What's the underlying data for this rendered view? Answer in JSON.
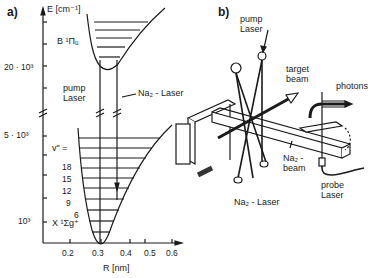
{
  "figure": {
    "panel_a": {
      "label": "a)",
      "y_axis_label": "E [cm⁻¹]",
      "y_ticks": [
        "20 · 10³",
        "5 · 10³",
        "10³"
      ],
      "x_axis_label": "R [nm]",
      "x_ticks": [
        "0.2",
        "0.3",
        "0.4",
        "0.5",
        "0.6"
      ],
      "upper_state": "B ¹Πᵤ",
      "lower_state": "X ¹Σg⁺",
      "vib_label": "v\" =",
      "vib_levels": [
        "18",
        "15",
        "12",
        "9",
        "6"
      ],
      "pump_label_1": "pump",
      "pump_label_2": "Laser",
      "na2_laser_label": "Na₂ - Laser"
    },
    "panel_b": {
      "label": "b)",
      "pump_label_1": "pump",
      "pump_label_2": "Laser",
      "target_label_1": "target",
      "target_label_2": "beam",
      "photons_label": "photons",
      "na2_beam_1": "Na₂ -",
      "na2_beam_2": "beam",
      "probe_1": "probe",
      "probe_2": "Laser",
      "na2_laser": "Na₂ - Laser"
    }
  }
}
